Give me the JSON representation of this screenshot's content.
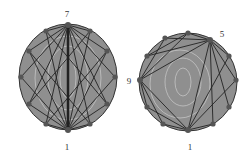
{
  "diagrams": [
    {
      "id": "left",
      "center": [
        68,
        77
      ],
      "rx": 49,
      "ry": 53,
      "node_count": 12,
      "labels": [
        {
          "text": "7",
          "x": 67,
          "y": 17
        },
        {
          "text": "1",
          "x": 67,
          "y": 148
        }
      ],
      "hub_top": 0,
      "hub_bottom": 6
    },
    {
      "id": "right",
      "center": [
        188,
        82
      ],
      "rx": 49,
      "ry": 49,
      "node_count": 12,
      "labels": [
        {
          "text": "5",
          "x": 222,
          "y": 37
        },
        {
          "text": "9",
          "x": 127,
          "y": 85
        },
        {
          "text": "1",
          "x": 190,
          "y": 148
        }
      ]
    }
  ],
  "colors": {
    "fill": "#8f8f8f",
    "stroke": "#2a2a2a",
    "node": "#555555",
    "contour": "#c8c8c8"
  }
}
